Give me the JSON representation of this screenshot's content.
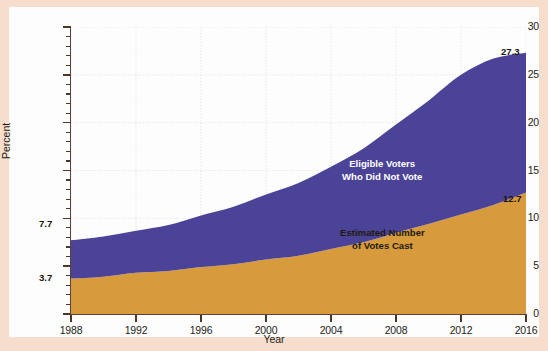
{
  "chart_data": {
    "type": "area",
    "stacked": true,
    "title": "",
    "xlabel": "Year",
    "ylabel": "Percent",
    "x": [
      1988,
      1990,
      1992,
      1994,
      1996,
      1998,
      2000,
      2002,
      2004,
      2006,
      2008,
      2010,
      2012,
      2014,
      2016
    ],
    "xlim": [
      1988,
      2016
    ],
    "ylim": [
      0,
      30
    ],
    "xticks": [
      "1988",
      "1992",
      "1996",
      "2000",
      "2004",
      "2008",
      "2012",
      "2016"
    ],
    "yticks": [
      "0",
      "5",
      "10",
      "15",
      "20",
      "25",
      "30"
    ],
    "ytick_step": 5,
    "yminor_step": 1,
    "grid": true,
    "grid_style": "dotted",
    "legend_position": "inside-plot",
    "series": [
      {
        "name": "Estimated Number of Votes Cast",
        "color": "#d79a3c",
        "label_color": "#231a0e",
        "values": [
          3.7,
          3.9,
          4.3,
          4.5,
          4.9,
          5.2,
          5.7,
          6.1,
          6.8,
          7.5,
          8.5,
          9.4,
          10.4,
          11.4,
          12.7
        ]
      },
      {
        "name": "Eligible Voters Who Did Not Vote",
        "color": "#4a4397",
        "label_color": "#ffffff",
        "values": [
          4.0,
          4.2,
          4.4,
          4.8,
          5.4,
          6.0,
          6.8,
          7.6,
          8.6,
          9.8,
          11.3,
          12.9,
          14.6,
          15.3,
          14.6
        ]
      }
    ],
    "cumulative_top": [
      7.7,
      8.1,
      8.7,
      9.3,
      10.3,
      11.2,
      12.5,
      13.7,
      15.4,
      17.3,
      19.8,
      22.3,
      25.0,
      26.7,
      27.3
    ],
    "annotations": [
      {
        "text": "7.7",
        "x": 1988,
        "y": 7.7,
        "series": "total",
        "position": "left-above"
      },
      {
        "text": "3.7",
        "x": 1988,
        "y": 3.7,
        "series": "votes",
        "position": "left-above"
      },
      {
        "text": "27.3",
        "x": 2016,
        "y": 27.3,
        "series": "total",
        "position": "right-above"
      },
      {
        "text": "12.7",
        "x": 2016,
        "y": 12.7,
        "series": "votes",
        "position": "right-above"
      }
    ],
    "in_plot_labels": [
      {
        "text_lines": [
          "Eligible Voters",
          "Who Did Not Vote"
        ],
        "color": "#ffffff"
      },
      {
        "text_lines": [
          "Estimated Number",
          "of Votes Cast"
        ],
        "color": "#231a0e"
      }
    ]
  },
  "axes": {
    "y_title": "Percent",
    "x_title": "Year",
    "y_labels": [
      "30",
      "25",
      "20",
      "15",
      "10",
      "5",
      "0"
    ],
    "x_labels": [
      "1988",
      "1992",
      "1996",
      "2000",
      "2004",
      "2008",
      "2012",
      "2016"
    ]
  },
  "labels": {
    "nonvoters_line1": "Eligible Voters",
    "nonvoters_line2": "Who Did Not Vote",
    "votes_line1": "Estimated Number",
    "votes_line2": "of Votes Cast",
    "tag_top_start": "7.7",
    "tag_bottom_start": "3.7",
    "tag_top_end": "27.3",
    "tag_bottom_end": "12.7"
  },
  "colors": {
    "votes_cast": "#d79a3c",
    "non_voters": "#4a4397",
    "panel_background": "#fdfdfd",
    "mat_background": "#f7ddcb",
    "axis": "#5a4332",
    "grid": "#e3e3e8"
  }
}
